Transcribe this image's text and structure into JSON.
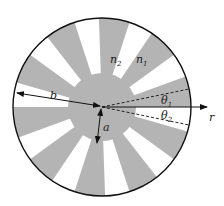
{
  "figure": {
    "type": "cross-section diagram",
    "colors": {
      "sector_n1": "#b4b4b4",
      "sector_n2": "#ffffff",
      "outline": "#111111",
      "background": "#ffffff"
    },
    "geometry": {
      "center": [
        102,
        107
      ],
      "outer_radius": 89,
      "core_radius": 34,
      "sector_period_deg": 36,
      "gray_start_deg": -20,
      "gray_width_deg": 20
    }
  },
  "labels": {
    "n2": "n",
    "n2_sub": "2",
    "n1": "n",
    "n1_sub": "1",
    "b": "b",
    "a": "a",
    "theta1": "θ",
    "theta1_sub": "1",
    "theta2": "θ",
    "theta2_sub": "2",
    "r": "r"
  }
}
